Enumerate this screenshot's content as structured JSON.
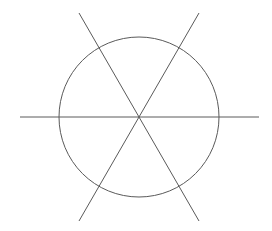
{
  "diagram": {
    "type": "geometric-figure",
    "stroke_color": "#5a5a5a",
    "stroke_width": 1,
    "background": "#ffffff",
    "circle": {
      "cx": 139,
      "cy": 117,
      "r": 80
    },
    "lines": [
      {
        "name": "horizontal-line",
        "angle_deg": 0,
        "x1": 20,
        "y1": 117,
        "x2": 259,
        "y2": 117
      },
      {
        "name": "diagonal-line-60",
        "angle_deg": 60,
        "x1": 79,
        "y1": 221,
        "x2": 199,
        "y2": 13
      },
      {
        "name": "diagonal-line-120",
        "angle_deg": 120,
        "x1": 79,
        "y1": 13,
        "x2": 199,
        "y2": 221
      }
    ]
  }
}
